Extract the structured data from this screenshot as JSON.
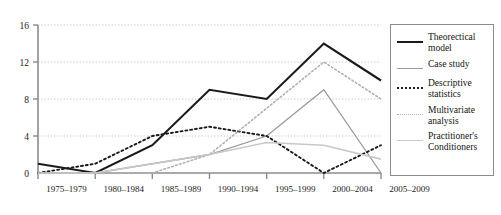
{
  "chart_data": {
    "type": "line",
    "title": "",
    "xlabel": "",
    "ylabel": "",
    "categories": [
      "1975–1979",
      "1980–1984",
      "1985–1989",
      "1990–1994",
      "1995–1999",
      "2000–2004",
      "2005–2009"
    ],
    "ylim": [
      0,
      16
    ],
    "yticks": [
      0,
      4,
      8,
      12,
      16
    ],
    "grid": true,
    "legend_position": "right",
    "series": [
      {
        "name": "Theorectical model",
        "style": "solid",
        "color": "#1a1a1a",
        "width": 2.1,
        "values": [
          1,
          0,
          3,
          9,
          8,
          14,
          10
        ]
      },
      {
        "name": "Case study",
        "style": "solid",
        "color": "#9a9a9a",
        "width": 1.3,
        "values": [
          0,
          0,
          1,
          2,
          4,
          9,
          0
        ]
      },
      {
        "name": "Descriptive statistics",
        "style": "dotted",
        "color": "#1a1a1a",
        "width": 1.9,
        "values": [
          0,
          1,
          4,
          5,
          4,
          0,
          3
        ]
      },
      {
        "name": "Multivariate analysis",
        "style": "dotted",
        "color": "#b0b0b0",
        "width": 1.6,
        "values": [
          0,
          0,
          0,
          2,
          7,
          12,
          8
        ]
      },
      {
        "name": "Practitioner's Conditioners",
        "style": "solid",
        "color": "#c8c8c8",
        "width": 1.6,
        "values": [
          0,
          0,
          1,
          2,
          3.3,
          3,
          1.5
        ]
      }
    ]
  },
  "legend": {
    "items": [
      {
        "label": "Theorectical\nmodel",
        "swatch": "solid-black-thick"
      },
      {
        "label": "Case study",
        "swatch": "solid-gray"
      },
      {
        "label": "Descriptive\nstatistics",
        "swatch": "dotted-black"
      },
      {
        "label": "Multivariate\nanalysis",
        "swatch": "dotted-gray"
      },
      {
        "label": "Practitioner's\nConditioners",
        "swatch": "solid-lightgray"
      }
    ]
  },
  "colors": {
    "axis": "#8c8c8c",
    "grid": "#c9c9c9",
    "text": "#1a1a1a",
    "background": "#ffffff"
  }
}
